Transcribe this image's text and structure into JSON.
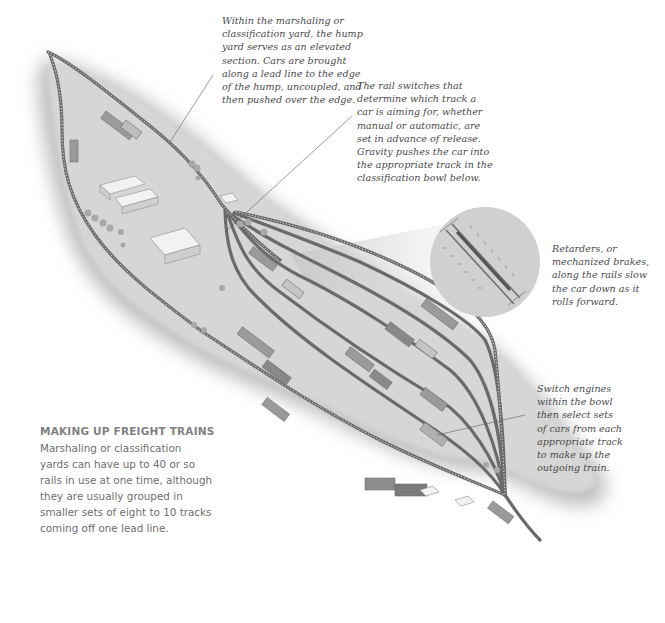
{
  "figure": {
    "colors": {
      "ground": "#d4d4d4",
      "ground_shadow": "#bdbdbd",
      "track": "#6a6a6a",
      "building": "#f2f2f2",
      "callout_text": "#4a4a4a",
      "sidebar_title": "#808080",
      "sidebar_body": "#6e6e6e",
      "magnifier": "#d0d0d0"
    }
  },
  "callouts": {
    "hump_yard": "Within the marshaling or\nclassification yard, the hump\nyard serves as an elevated\nsection. Cars are brought\nalong a lead line to the edge\nof the hump, uncoupled, and\nthen pushed over the edge.",
    "rail_switches": "The rail switches that\ndetermine which track a\ncar is aiming for, whether\nmanual or automatic, are\nset in advance of release.\nGravity pushes the car into\nthe appropriate track in the\nclassification bowl below.",
    "retarders": "Retarders, or\nmechanized brakes,\nalong the rails slow\nthe car down as it\nrolls forward.",
    "switch_engines": "Switch engines\nwithin the bowl\nthen select sets\nof cars from each\nappropriate track\nto make up the\noutgoing train."
  },
  "sidebar": {
    "title": "MAKING UP FREIGHT TRAINS",
    "body": "Marshaling or classification\nyards can have up to 40 or so\nrails in use at one time, although\nthey are usually grouped in\nsmaller sets of eight to 10 tracks\ncoming off one lead line."
  }
}
